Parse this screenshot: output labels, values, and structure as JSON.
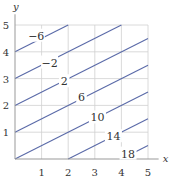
{
  "chart_data": {
    "type": "line",
    "title": "",
    "xlabel": "x",
    "ylabel": "y",
    "xlim": [
      0,
      5
    ],
    "ylim": [
      0,
      5
    ],
    "grid": true,
    "x_ticks": [
      "1",
      "2",
      "3",
      "4",
      "5"
    ],
    "y_ticks": [
      "1",
      "2",
      "3",
      "4",
      "5"
    ],
    "contours": [
      {
        "level": "-6",
        "points": [
          [
            0,
            4
          ],
          [
            2,
            5
          ]
        ],
        "label_at": [
          0.8,
          4.6
        ]
      },
      {
        "level": "-2",
        "points": [
          [
            0,
            3
          ],
          [
            4,
            5
          ]
        ],
        "label_at": [
          1.3,
          3.6
        ]
      },
      {
        "level": "2",
        "points": [
          [
            0,
            2
          ],
          [
            5,
            4.5
          ]
        ],
        "label_at": [
          1.85,
          2.9
        ]
      },
      {
        "level": "6",
        "points": [
          [
            0,
            1
          ],
          [
            5,
            3.5
          ]
        ],
        "label_at": [
          2.5,
          2.3
        ]
      },
      {
        "level": "10",
        "points": [
          [
            0,
            0
          ],
          [
            5,
            2.5
          ]
        ],
        "label_at": [
          3.1,
          1.55
        ]
      },
      {
        "level": "14",
        "points": [
          [
            2,
            0
          ],
          [
            5,
            1.5
          ]
        ],
        "label_at": [
          3.7,
          0.85
        ]
      },
      {
        "level": "18",
        "points": [
          [
            4,
            0
          ],
          [
            5,
            0.5
          ]
        ],
        "label_at": [
          4.25,
          0.2
        ]
      }
    ],
    "colors": {
      "contour": "#5a6aa8",
      "grid": "#d0d0d0",
      "axis": "#999999"
    }
  }
}
